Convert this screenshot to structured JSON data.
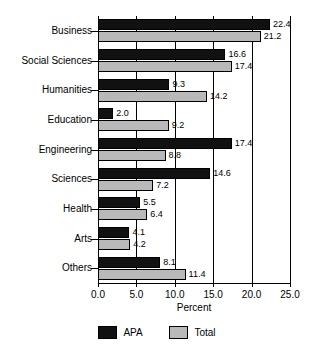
{
  "chart_data": {
    "type": "bar",
    "orientation": "horizontal",
    "title": "",
    "xlabel": "Percent",
    "ylabel": "",
    "xlim": [
      0.0,
      25.0
    ],
    "xticks": [
      "0.0",
      "5.0",
      "10.0",
      "15.0",
      "20.0",
      "25.0"
    ],
    "xtick_values": [
      0.0,
      5.0,
      10.0,
      15.0,
      20.0,
      25.0
    ],
    "grid": "vertical",
    "legend_position": "bottom",
    "categories": [
      "Business",
      "Social Sciences",
      "Humanities",
      "Education",
      "Engineering",
      "Sciences",
      "Health",
      "Arts",
      "Others"
    ],
    "series": [
      {
        "name": "APA",
        "color": "#111111",
        "values": [
          22.4,
          16.6,
          9.3,
          2.0,
          17.4,
          14.6,
          5.5,
          4.1,
          8.1
        ],
        "labels": [
          "22.4",
          "16.6",
          "9.3",
          "2.0",
          "17.4",
          "14.6",
          "5.5",
          "4.1",
          "8.1"
        ]
      },
      {
        "name": "Total",
        "color": "#b9b9b9",
        "values": [
          21.2,
          17.4,
          14.2,
          9.2,
          8.8,
          7.2,
          6.4,
          4.2,
          11.4
        ],
        "labels": [
          "21.2",
          "17.4",
          "14.2",
          "9.2",
          "8.8",
          "7.2",
          "6.4",
          "4.2",
          "11.4"
        ]
      }
    ]
  },
  "legend": {
    "items": [
      {
        "label": "APA",
        "color": "#111111"
      },
      {
        "label": "Total",
        "color": "#b9b9b9"
      }
    ]
  },
  "axis": {
    "x_title": "Percent"
  }
}
